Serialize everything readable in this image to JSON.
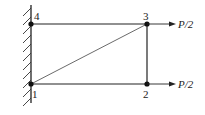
{
  "diagram": {
    "type": "truss-structure",
    "support": {
      "type": "fixed-wall",
      "side": "left"
    },
    "nodes": [
      {
        "id": "1",
        "label": "1",
        "x": 31,
        "y": 84
      },
      {
        "id": "2",
        "label": "2",
        "x": 147,
        "y": 84
      },
      {
        "id": "3",
        "label": "3",
        "x": 147,
        "y": 24
      },
      {
        "id": "4",
        "label": "4",
        "x": 31,
        "y": 24
      }
    ],
    "members": [
      {
        "from": "1",
        "to": "2"
      },
      {
        "from": "2",
        "to": "3"
      },
      {
        "from": "3",
        "to": "4"
      },
      {
        "from": "1",
        "to": "3"
      }
    ],
    "loads": [
      {
        "node": "3",
        "direction": "right",
        "label": "P/2"
      },
      {
        "node": "2",
        "direction": "right",
        "label": "P/2"
      }
    ]
  }
}
